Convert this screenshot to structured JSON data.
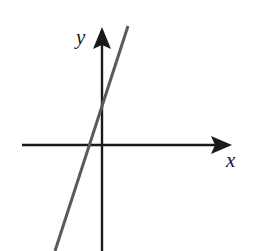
{
  "figure": {
    "title": "",
    "background_color": "#ffffff",
    "width": 253,
    "height": 251,
    "axis_color": "#1a1a1a",
    "line_color": "#5a5a5a"
  },
  "labels": {
    "x_axis": "x",
    "y_axis": "y"
  },
  "icons": {
    "x_arrowhead": "arrow-right-icon",
    "y_arrowhead": "arrow-up-icon"
  },
  "chart_data": {
    "type": "line",
    "title": "",
    "xlabel": "x",
    "ylabel": "y",
    "grid": false,
    "legend": null,
    "annotations": [],
    "axes": {
      "origin_px": [
        102,
        145
      ],
      "x_axis_px": {
        "x1": 22,
        "y1": 145,
        "x2": 232,
        "y2": 145,
        "arrow": "right"
      },
      "y_axis_px": {
        "x1": 102,
        "y1": 28,
        "x2": 102,
        "y2": 251,
        "arrow": "up"
      },
      "xlim": [
        -5.0,
        8.5
      ],
      "ylim": [
        -4.3,
        4.7
      ],
      "x_ticks": [],
      "y_ticks": []
    },
    "series": [
      {
        "name": "line",
        "color": "#5a5a5a",
        "width_px": 3,
        "endpoints_px": [
          [
            128,
            26
          ],
          [
            55,
            251
          ]
        ],
        "x_intercept": -0.56,
        "y_intercept": 1.64,
        "slope": 2.95,
        "x": [
          -1.88,
          1.04
        ],
        "y": [
          -4.24,
          4.76
        ]
      }
    ]
  }
}
